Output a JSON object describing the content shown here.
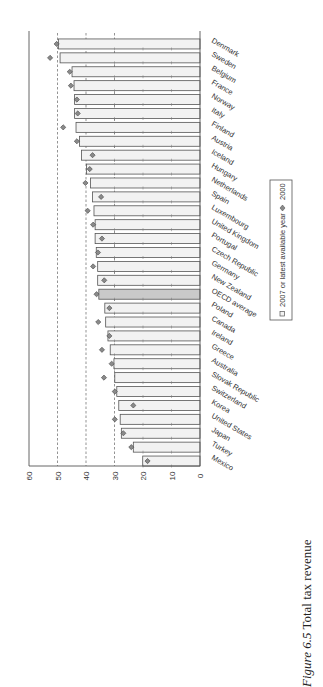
{
  "figure": {
    "label": "Figure 6.5",
    "title": "Total tax revenue"
  },
  "legend": {
    "items": [
      {
        "label": "2007 or latest available year",
        "marker": "square"
      },
      {
        "label": "2000",
        "marker": "diamond"
      }
    ]
  },
  "colors": {
    "bar_fill": "#f2f2f2",
    "bar_highlight_fill": "#c9c9c9",
    "bar_stroke": "#555555",
    "diamond_fill": "#8a8a8a",
    "diamond_stroke": "#444444",
    "axis": "#555555",
    "refline": "#666666"
  },
  "chart_data": {
    "type": "bar",
    "orientation": "rotated-90-ccw",
    "title": "Total tax revenue",
    "xlabel": "",
    "ylabel": "",
    "ylim": [
      0,
      60
    ],
    "yticks": [
      0,
      10,
      20,
      30,
      40,
      50,
      60
    ],
    "reference_lines": [
      30,
      40,
      50
    ],
    "grid": false,
    "legend_position": "right (below chart in rotated view)",
    "highlight_category": "OECD average",
    "categories": [
      "Denmark",
      "Sweden",
      "Belgium",
      "France",
      "Norway",
      "Italy",
      "Finland",
      "Austria",
      "Iceland",
      "Hungary",
      "Netherlands",
      "Spain",
      "Luxembourg",
      "United Kingdom",
      "Portugal",
      "Czech Republic",
      "Germany",
      "New Zealand",
      "OECD average",
      "Poland",
      "Canada",
      "Ireland",
      "Greece",
      "Australia",
      "Slovak Republic",
      "Switzerland",
      "Korea",
      "United States",
      "Japan",
      "Turkey",
      "Mexico"
    ],
    "series": [
      {
        "name": "2007 or latest available year",
        "type": "bar",
        "values": [
          49.7,
          49.1,
          44.9,
          44.2,
          44.0,
          44.0,
          43.5,
          42.3,
          41.6,
          39.8,
          38.4,
          37.7,
          37.2,
          36.8,
          36.8,
          36.4,
          35.9,
          35.9,
          35.5,
          33.4,
          33.1,
          32.3,
          31.5,
          30.2,
          29.9,
          29.2,
          28.5,
          28.0,
          27.6,
          23.4,
          20.1
        ]
      },
      {
        "name": "2000",
        "type": "marker-diamond",
        "values": [
          50.3,
          52.6,
          45.7,
          45.3,
          43.2,
          42.9,
          48.0,
          43.2,
          37.7,
          38.7,
          40.2,
          34.7,
          39.4,
          37.5,
          34.4,
          35.8,
          37.5,
          33.6,
          36.3,
          31.8,
          35.7,
          31.8,
          34.4,
          31.0,
          33.7,
          29.9,
          23.4,
          29.9,
          26.9,
          24.1,
          18.4
        ]
      }
    ]
  }
}
